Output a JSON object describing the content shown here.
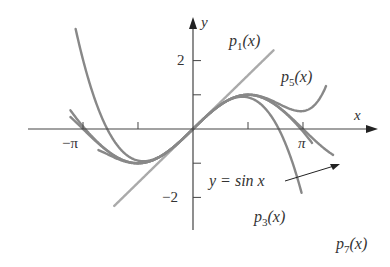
{
  "chart_data": {
    "type": "line",
    "title": "",
    "xlabel": "x",
    "ylabel": "y",
    "xlim": [
      -3.6,
      4.1
    ],
    "ylim": [
      -3.0,
      3.0
    ],
    "x_ticks": [
      {
        "value": -3.14159,
        "label": "−π"
      },
      {
        "value": -1.5708,
        "label": ""
      },
      {
        "value": 1.5708,
        "label": ""
      },
      {
        "value": 3.14159,
        "label": "π"
      }
    ],
    "y_ticks": [
      {
        "value": 2,
        "label": "2"
      },
      {
        "value": 1,
        "label": ""
      },
      {
        "value": -1,
        "label": ""
      },
      {
        "value": -2,
        "label": "−2"
      }
    ],
    "grid": false,
    "series": [
      {
        "name": "y = sin x",
        "function": "sin(x)",
        "x_range": [
          -3.5,
          4.0
        ],
        "color": "#888888"
      },
      {
        "name": "p1(x)",
        "function": "x",
        "x_range": [
          -2.25,
          2.3
        ],
        "color": "#aaaaaa"
      },
      {
        "name": "p3(x)",
        "function": "x - x^3/6",
        "x_range": [
          -3.45,
          3.1
        ],
        "color": "#888888"
      },
      {
        "name": "p5(x)",
        "function": "x - x^3/6 + x^5/120",
        "x_range": [
          -2.7,
          3.8
        ],
        "color": "#888888"
      },
      {
        "name": "p7(x)",
        "function": "x - x^3/6 + x^5/120 - x^7/5040",
        "x_range": [
          -3.5,
          3.4
        ],
        "color": "#888888"
      }
    ],
    "annotations": [
      {
        "text": "p1(x)",
        "near": "line y=x upper end"
      },
      {
        "text": "p5(x)",
        "near": "upper right"
      },
      {
        "text": "y = sin x",
        "arrow_to": "sin curve near x≈3.9"
      },
      {
        "text": "p3(x)",
        "near": "bottom center-right"
      },
      {
        "text": "p7(x)",
        "near": "bottom right"
      }
    ]
  },
  "labels": {
    "x_axis": "x",
    "y_axis": "y",
    "neg_pi": "−π",
    "pi": "π",
    "y2": "2",
    "yneg2": "−2",
    "p1": "p",
    "p1_sub": "1",
    "p3": "p",
    "p3_sub": "3",
    "p5": "p",
    "p5_sub": "5",
    "p7": "p",
    "p7_sub": "7",
    "arg": "(x)",
    "sin_label": "y = sin x"
  }
}
